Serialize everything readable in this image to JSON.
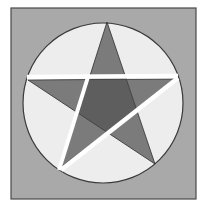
{
  "diagram": {
    "canvas": {
      "width": 209,
      "height": 206,
      "background": "#ffffff"
    },
    "square": {
      "x": 11,
      "y": 8,
      "width": 185,
      "height": 191,
      "fill": "#a9a9a9",
      "stroke": "#4a4a4a"
    },
    "circle": {
      "cx": 103,
      "cy": 103,
      "r": 80,
      "fill": "#ededed",
      "stroke": "#3a3a3a"
    },
    "star": {
      "points": {
        "top": [
          107,
          22
        ],
        "left": [
          28,
          80
        ],
        "right": [
          177,
          79
        ],
        "bottom_left": [
          61,
          167
        ],
        "bottom_right": [
          155,
          164
        ]
      },
      "arm_fill": "#7b7b7b",
      "center_fill": "#5e5e5e",
      "stroke": "#2e2e2e"
    },
    "cuts": [
      {
        "name": "horizontal-cut",
        "from": [
          27,
          77
        ],
        "to": [
          178,
          76
        ],
        "width": 4.5,
        "color": "#ffffff"
      },
      {
        "name": "left-diagonal-cut",
        "from": [
          88,
          77
        ],
        "to": [
          59,
          170
        ],
        "width": 4,
        "color": "#ffffff"
      },
      {
        "name": "right-diagonal-cut",
        "from": [
          178,
          78
        ],
        "to": [
          61,
          170
        ],
        "width": 4.5,
        "color": "#ffffff"
      }
    ]
  }
}
